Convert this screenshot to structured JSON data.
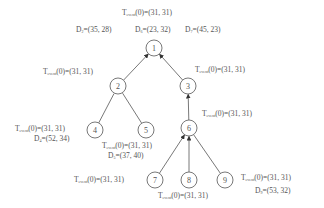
{
  "diagram": {
    "type": "tree",
    "t_label_symbol": "T",
    "t_label_sub": "event",
    "nodes": [
      {
        "id": "1",
        "x": 154,
        "y": 48
      },
      {
        "id": "2",
        "x": 118,
        "y": 86
      },
      {
        "id": "3",
        "x": 188,
        "y": 86
      },
      {
        "id": "4",
        "x": 95,
        "y": 130
      },
      {
        "id": "5",
        "x": 146,
        "y": 130
      },
      {
        "id": "6",
        "x": 189,
        "y": 128
      },
      {
        "id": "7",
        "x": 155,
        "y": 180
      },
      {
        "id": "8",
        "x": 189,
        "y": 180
      },
      {
        "id": "9",
        "x": 225,
        "y": 180
      }
    ],
    "edges": [
      {
        "from": "2",
        "to": "1",
        "arrow": true
      },
      {
        "from": "3",
        "to": "1",
        "arrow": true
      },
      {
        "from": "4",
        "to": "2",
        "arrow": false
      },
      {
        "from": "5",
        "to": "2",
        "arrow": false
      },
      {
        "from": "6",
        "to": "3",
        "arrow": true
      },
      {
        "from": "7",
        "to": "6",
        "arrow": true
      },
      {
        "from": "8",
        "to": "6",
        "arrow": true
      },
      {
        "from": "9",
        "to": "6",
        "arrow": false
      }
    ],
    "labels": {
      "n1_t": {
        "arg": "(0)",
        "value": "=(31, 31)"
      },
      "d2": {
        "name": "D",
        "sub": "2",
        "value": "=(35, 28)"
      },
      "d6": {
        "name": "D",
        "sub": "6",
        "value": "=(23, 32)"
      },
      "d7": {
        "name": "D",
        "sub": "7",
        "value": "=(45, 23)"
      },
      "n2_t": {
        "arg": "(0)",
        "value": "=(31, 31)"
      },
      "n3_t": {
        "arg": "(0)",
        "value": "=(31, 31)"
      },
      "n4_t": {
        "arg": "(0)",
        "value": "=(31, 31)"
      },
      "d4": {
        "name": "D",
        "sub": "4",
        "value": "=(52, 34)"
      },
      "n5_t": {
        "arg": "(0)",
        "value": "=(31, 31)"
      },
      "d5": {
        "name": "D",
        "sub": "5",
        "value": "=(37, 40)"
      },
      "n6_t": {
        "arg": "(0)",
        "value": "=(31, 31)"
      },
      "n7_t": {
        "arg": "(0)",
        "value": "=(31, 31)"
      },
      "n8_t": {
        "arg": "(0)",
        "value": "=(31, 31)"
      },
      "n9_t": {
        "arg": "(0)",
        "value": "=(31, 31)"
      },
      "d9": {
        "name": "D",
        "sub": "9",
        "value": "=(53, 32)"
      }
    }
  }
}
